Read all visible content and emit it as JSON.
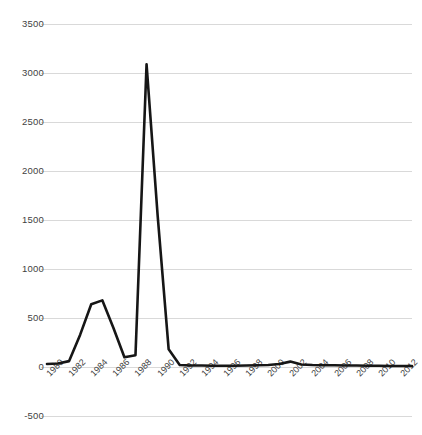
{
  "chart_data": {
    "type": "line",
    "title": "",
    "subtitle": "",
    "xlabel": "",
    "ylabel": "",
    "grid": true,
    "legend": false,
    "legend_position": "none",
    "line_color": "#161616",
    "grid_color": "#d9d9d9",
    "text_color": "#3f3f3f",
    "ylim": [
      -500,
      3500
    ],
    "ytick_step": 500,
    "ytick_labels": [
      "3500",
      "3000",
      "2500",
      "2000",
      "1500",
      "1000",
      "500",
      "0",
      "-500"
    ],
    "ytick_values": [
      3500,
      3000,
      2500,
      2000,
      1500,
      1000,
      500,
      0,
      -500
    ],
    "xlim": [
      1980,
      2013
    ],
    "xtick_step": 2,
    "xtick_labels": [
      "1980",
      "1982",
      "1984",
      "1986",
      "1988",
      "1990",
      "1992",
      "1994",
      "1996",
      "1998",
      "2000",
      "2002",
      "2004",
      "2006",
      "2008",
      "2010",
      "2012"
    ],
    "x": [
      1980,
      1981,
      1982,
      1983,
      1984,
      1985,
      1986,
      1987,
      1988,
      1989,
      1990,
      1991,
      1992,
      1993,
      1994,
      1995,
      1996,
      1997,
      1998,
      1999,
      2000,
      2001,
      2002,
      2003,
      2004,
      2005,
      2006,
      2007,
      2008,
      2009,
      2010,
      2011,
      2012,
      2013
    ],
    "values": [
      30,
      35,
      60,
      330,
      640,
      680,
      400,
      100,
      120,
      3090,
      1550,
      180,
      20,
      15,
      15,
      12,
      12,
      12,
      15,
      18,
      20,
      30,
      55,
      25,
      20,
      18,
      18,
      15,
      15,
      12,
      12,
      10,
      10,
      10
    ]
  }
}
